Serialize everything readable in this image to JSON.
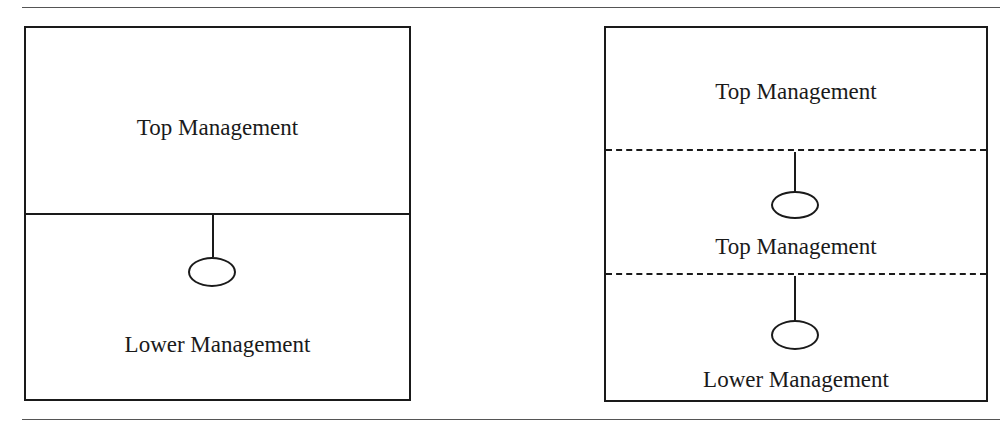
{
  "diagram": {
    "type": "organizational-levels",
    "left_panel": {
      "sections": [
        {
          "label": "Top Management",
          "divider_below": "solid"
        },
        {
          "label": "Lower Management"
        }
      ],
      "connectors": [
        {
          "from": "Top Management",
          "to": "Lower Management",
          "shape": "stem-with-oval"
        }
      ]
    },
    "right_panel": {
      "sections": [
        {
          "label": "Top Management",
          "divider_below": "dashed"
        },
        {
          "label": "Top Management",
          "divider_below": "dashed"
        },
        {
          "label": "Lower Management"
        }
      ],
      "connectors": [
        {
          "from": "section-1",
          "to": "section-2",
          "shape": "stem-with-oval"
        },
        {
          "from": "section-2",
          "to": "section-3",
          "shape": "stem-with-oval"
        }
      ]
    }
  }
}
